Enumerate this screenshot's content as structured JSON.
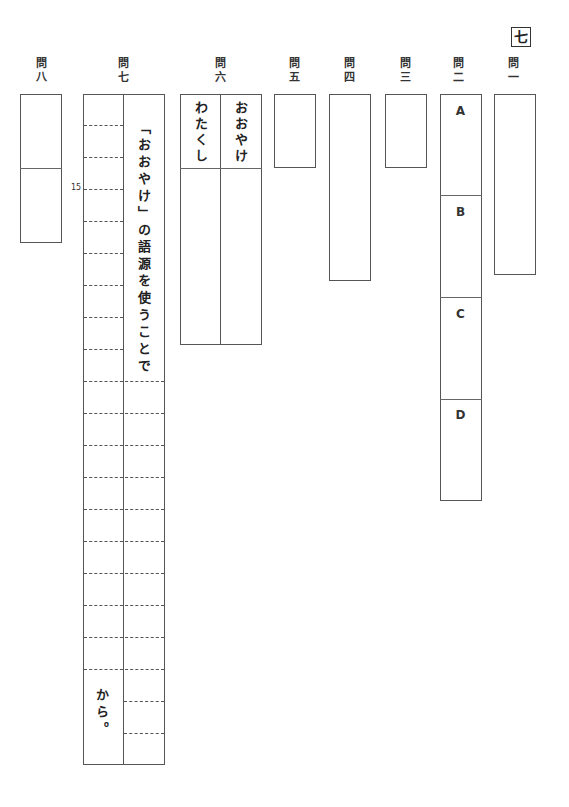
{
  "section": {
    "label": "七"
  },
  "questions": [
    {
      "id": "q1",
      "label_top": "問",
      "label_bottom": "一"
    },
    {
      "id": "q2",
      "label_top": "問",
      "label_bottom": "二",
      "parts": [
        "A",
        "B",
        "C",
        "D"
      ]
    },
    {
      "id": "q3",
      "label_top": "問",
      "label_bottom": "三"
    },
    {
      "id": "q4",
      "label_top": "問",
      "label_bottom": "四"
    },
    {
      "id": "q5",
      "label_top": "問",
      "label_bottom": "五"
    },
    {
      "id": "q6",
      "label_top": "問",
      "label_bottom": "六",
      "columns": [
        "おおやけ",
        "わたくし"
      ]
    },
    {
      "id": "q7",
      "label_top": "問",
      "label_bottom": "七",
      "prefix": "「おおやけ」の語源を使うことで",
      "suffix": "から。",
      "marker": "15"
    },
    {
      "id": "q8",
      "label_top": "問",
      "label_bottom": "八"
    }
  ]
}
